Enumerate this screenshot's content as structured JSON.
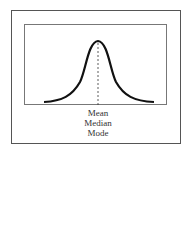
{
  "diagram": {
    "type": "normal-distribution-curve",
    "labels": [
      "Mean",
      "Median",
      "Mode"
    ],
    "annotation": "dashed vertical line at peak marking central tendency"
  }
}
